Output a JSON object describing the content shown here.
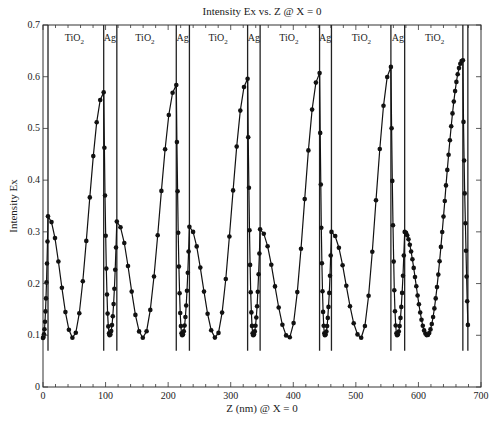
{
  "chart_data": {
    "type": "line",
    "title": "Intensity Ex vs. Z @ X = 0",
    "xlabel": "Z (nm) @ X = 0",
    "ylabel": "Intensity Ex",
    "xlim": [
      0,
      700
    ],
    "ylim": [
      0,
      0.7
    ],
    "xticks": [
      0,
      100,
      200,
      300,
      400,
      500,
      600,
      700
    ],
    "yticks": [
      0,
      0.1,
      0.2,
      0.3,
      0.4,
      0.5,
      0.6,
      0.7
    ],
    "xtick_labels": [
      "0",
      "100",
      "200",
      "300",
      "400",
      "500",
      "600",
      "700"
    ],
    "ytick_labels": [
      "0",
      "0.1",
      "0.2",
      "0.3",
      "0.4",
      "0.5",
      "0.6",
      "0.7"
    ],
    "grid": false,
    "legend": null,
    "layer_boundaries_nm": [
      8,
      97,
      118,
      213,
      234,
      327,
      347,
      442,
      461,
      556,
      578,
      671,
      679
    ],
    "boundary_line_bottom": 0.07,
    "region_labels": [
      {
        "text": "TiO",
        "sub": "2",
        "z": 50
      },
      {
        "text": "Ag",
        "sub": "",
        "z": 107
      },
      {
        "text": "TiO",
        "sub": "2",
        "z": 163
      },
      {
        "text": "Ag",
        "sub": "",
        "z": 223
      },
      {
        "text": "TiO",
        "sub": "2",
        "z": 280
      },
      {
        "text": "Ag",
        "sub": "",
        "z": 337
      },
      {
        "text": "TiO",
        "sub": "2",
        "z": 393
      },
      {
        "text": "Ag",
        "sub": "",
        "z": 451
      },
      {
        "text": "TiO",
        "sub": "2",
        "z": 509
      },
      {
        "text": "Ag",
        "sub": "",
        "z": 567
      },
      {
        "text": "TiO",
        "sub": "2",
        "z": 626
      }
    ],
    "series": [
      {
        "name": "Intensity Ex",
        "marker": "circle",
        "color": "#111111",
        "segments": [
          {
            "ag_start": 0,
            "ag_min": 0.095,
            "small_peak_z": 8,
            "small_peak": 0.33,
            "tio2_min_z": 48,
            "tio2_min": 0.095,
            "big_peak_z": 97,
            "big_peak": 0.57
          },
          {
            "ag_start": 97,
            "ag_min": 0.1,
            "small_peak_z": 118,
            "small_peak": 0.32,
            "tio2_min_z": 160,
            "tio2_min": 0.095,
            "big_peak_z": 213,
            "big_peak": 0.584
          },
          {
            "ag_start": 213,
            "ag_min": 0.1,
            "small_peak_z": 234,
            "small_peak": 0.31,
            "tio2_min_z": 276,
            "tio2_min": 0.095,
            "big_peak_z": 327,
            "big_peak": 0.596
          },
          {
            "ag_start": 327,
            "ag_min": 0.1,
            "small_peak_z": 347,
            "small_peak": 0.305,
            "tio2_min_z": 393,
            "tio2_min": 0.095,
            "big_peak_z": 442,
            "big_peak": 0.607
          },
          {
            "ag_start": 442,
            "ag_min": 0.1,
            "small_peak_z": 461,
            "small_peak": 0.3,
            "tio2_min_z": 508,
            "tio2_min": 0.095,
            "big_peak_z": 556,
            "big_peak": 0.619
          },
          {
            "ag_start": 556,
            "ag_min": 0.1,
            "small_peak_z": 578,
            "small_peak": 0.3,
            "tio2_min_z": 614,
            "tio2_min": 0.1,
            "big_peak_z": 671,
            "big_peak": 0.632,
            "dense": true
          },
          {
            "ag_start": 671,
            "ag_min": 0.12,
            "end_z": 679
          }
        ]
      }
    ]
  }
}
